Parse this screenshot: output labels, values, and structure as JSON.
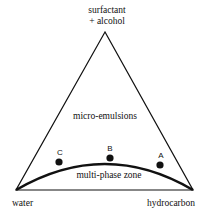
{
  "diagram": {
    "type": "ternary-phase-diagram",
    "vertices": {
      "top": "surfactant + alcohol",
      "top_line1": "surfactant",
      "top_line2": "+ alcohol",
      "bottom_left": "water",
      "bottom_right": "hydrocarbon"
    },
    "regions": {
      "upper": "micro-emulsions",
      "lower": "multi-phase zone"
    },
    "points": [
      {
        "label": "C",
        "x": 59,
        "y": 162
      },
      {
        "label": "B",
        "x": 110,
        "y": 158
      },
      {
        "label": "A",
        "x": 160,
        "y": 165
      }
    ],
    "colors": {
      "line": "#111111",
      "point": "#111111",
      "background": "#ffffff"
    }
  }
}
